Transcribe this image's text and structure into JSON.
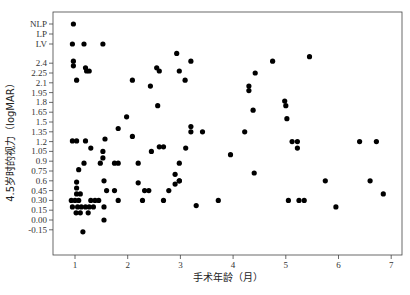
{
  "chart_data": {
    "type": "scatter",
    "title": "",
    "xlabel": "手术年龄（月）",
    "ylabel": "4.5岁时的视力（logMAR）",
    "xlim": [
      0.57,
      7.2
    ],
    "x_ticks": [
      1,
      2,
      3,
      4,
      5,
      6,
      7
    ],
    "y_ticks": [
      {
        "label": "NLP",
        "value": "NLP"
      },
      {
        "label": "LP",
        "value": "LP"
      },
      {
        "label": "LV",
        "value": "LV"
      },
      {
        "label": "2.4",
        "value": 2.4
      },
      {
        "label": "2.25",
        "value": 2.25
      },
      {
        "label": "2.1",
        "value": 2.1
      },
      {
        "label": "1.95",
        "value": 1.95
      },
      {
        "label": "1.8",
        "value": 1.8
      },
      {
        "label": "1.65",
        "value": 1.65
      },
      {
        "label": "1.5",
        "value": 1.5
      },
      {
        "label": "1.35",
        "value": 1.35
      },
      {
        "label": "1.2",
        "value": 1.2
      },
      {
        "label": "1.05",
        "value": 1.05
      },
      {
        "label": "0.9",
        "value": 0.9
      },
      {
        "label": "0.75",
        "value": 0.75
      },
      {
        "label": "0.6",
        "value": 0.6
      },
      {
        "label": "0.45",
        "value": 0.45
      },
      {
        "label": "0.30",
        "value": 0.3
      },
      {
        "label": "0.15",
        "value": 0.15
      },
      {
        "label": "0.00",
        "value": 0.0
      },
      {
        "label": "-0.15",
        "value": -0.15
      }
    ],
    "grid": false,
    "legend": null,
    "points": [
      {
        "x": 0.97,
        "y": "NLP"
      },
      {
        "x": 0.95,
        "y": "LV"
      },
      {
        "x": 1.17,
        "y": "LV"
      },
      {
        "x": 1.53,
        "y": "LV"
      },
      {
        "x": 2.93,
        "y": 2.55
      },
      {
        "x": 0.97,
        "y": 2.43
      },
      {
        "x": 0.97,
        "y": 2.36
      },
      {
        "x": 1.2,
        "y": 2.33
      },
      {
        "x": 1.22,
        "y": 2.28
      },
      {
        "x": 1.27,
        "y": 2.28
      },
      {
        "x": 1.03,
        "y": 2.14
      },
      {
        "x": 2.55,
        "y": 2.33
      },
      {
        "x": 2.6,
        "y": 2.28
      },
      {
        "x": 2.98,
        "y": 2.28
      },
      {
        "x": 3.2,
        "y": 2.43
      },
      {
        "x": 2.09,
        "y": 2.14
      },
      {
        "x": 2.43,
        "y": 2.05
      },
      {
        "x": 3.09,
        "y": 2.14
      },
      {
        "x": 2.57,
        "y": 1.75
      },
      {
        "x": 1.55,
        "y": 0.0
      },
      {
        "x": 0.95,
        "y": 1.21
      },
      {
        "x": 1.03,
        "y": 1.21
      },
      {
        "x": 1.2,
        "y": 1.21
      },
      {
        "x": 1.57,
        "y": 1.24
      },
      {
        "x": 1.98,
        "y": 1.58
      },
      {
        "x": 1.82,
        "y": 1.4
      },
      {
        "x": 1.3,
        "y": 1.1
      },
      {
        "x": 1.53,
        "y": 1.05
      },
      {
        "x": 1.53,
        "y": 0.95
      },
      {
        "x": 1.48,
        "y": 0.87
      },
      {
        "x": 2.09,
        "y": 1.28
      },
      {
        "x": 2.6,
        "y": 1.12
      },
      {
        "x": 2.68,
        "y": 1.12
      },
      {
        "x": 2.45,
        "y": 1.05
      },
      {
        "x": 1.75,
        "y": 0.87
      },
      {
        "x": 1.82,
        "y": 0.87
      },
      {
        "x": 2.2,
        "y": 0.87
      },
      {
        "x": 2.98,
        "y": 0.87
      },
      {
        "x": 3.2,
        "y": 1.43
      },
      {
        "x": 3.2,
        "y": 1.35
      },
      {
        "x": 3.42,
        "y": 1.35
      },
      {
        "x": 3.1,
        "y": 1.1
      },
      {
        "x": 4.75,
        "y": 2.43
      },
      {
        "x": 3.95,
        "y": 1.0
      },
      {
        "x": 2.9,
        "y": 0.7
      },
      {
        "x": 2.98,
        "y": 0.6
      },
      {
        "x": 2.9,
        "y": 0.55
      },
      {
        "x": 2.78,
        "y": 0.45
      },
      {
        "x": 2.2,
        "y": 0.57
      },
      {
        "x": 2.32,
        "y": 0.45
      },
      {
        "x": 2.28,
        "y": 0.3
      },
      {
        "x": 2.4,
        "y": 0.45
      },
      {
        "x": 2.68,
        "y": 0.3
      },
      {
        "x": 2.98,
        "y": 0.6
      },
      {
        "x": 3.3,
        "y": 0.22
      },
      {
        "x": 3.72,
        "y": 0.3
      },
      {
        "x": 1.07,
        "y": 0.77
      },
      {
        "x": 1.17,
        "y": 0.87
      },
      {
        "x": 1.55,
        "y": 0.6
      },
      {
        "x": 1.03,
        "y": 0.58
      },
      {
        "x": 1.03,
        "y": 0.49
      },
      {
        "x": 1.03,
        "y": 0.4
      },
      {
        "x": 1.1,
        "y": 0.4
      },
      {
        "x": 0.93,
        "y": 0.3
      },
      {
        "x": 1.0,
        "y": 0.3
      },
      {
        "x": 1.07,
        "y": 0.3
      },
      {
        "x": 1.3,
        "y": 0.3
      },
      {
        "x": 1.38,
        "y": 0.3
      },
      {
        "x": 1.45,
        "y": 0.3
      },
      {
        "x": 0.95,
        "y": 0.2
      },
      {
        "x": 1.05,
        "y": 0.2
      },
      {
        "x": 1.12,
        "y": 0.2
      },
      {
        "x": 1.2,
        "y": 0.2
      },
      {
        "x": 1.27,
        "y": 0.2
      },
      {
        "x": 1.35,
        "y": 0.2
      },
      {
        "x": 1.55,
        "y": 0.2
      },
      {
        "x": 1.02,
        "y": 0.11
      },
      {
        "x": 1.1,
        "y": 0.11
      },
      {
        "x": 1.25,
        "y": 0.11
      },
      {
        "x": 1.6,
        "y": 0.45
      },
      {
        "x": 1.75,
        "y": 0.45
      },
      {
        "x": 1.82,
        "y": 0.3
      },
      {
        "x": 1.15,
        "y": -0.18
      },
      {
        "x": 4.3,
        "y": 2.05
      },
      {
        "x": 4.3,
        "y": 1.98
      },
      {
        "x": 4.42,
        "y": 2.25
      },
      {
        "x": 4.38,
        "y": 1.68
      },
      {
        "x": 4.22,
        "y": 1.35
      },
      {
        "x": 4.4,
        "y": 0.72
      },
      {
        "x": 4.98,
        "y": 1.82
      },
      {
        "x": 5.0,
        "y": 1.75
      },
      {
        "x": 5.02,
        "y": 1.55
      },
      {
        "x": 5.45,
        "y": 2.5
      },
      {
        "x": 5.12,
        "y": 1.2
      },
      {
        "x": 5.22,
        "y": 1.2
      },
      {
        "x": 5.22,
        "y": 1.1
      },
      {
        "x": 5.05,
        "y": 0.3
      },
      {
        "x": 5.25,
        "y": 0.3
      },
      {
        "x": 5.35,
        "y": 0.3
      },
      {
        "x": 5.75,
        "y": 0.6
      },
      {
        "x": 5.95,
        "y": 0.2
      },
      {
        "x": 6.4,
        "y": 1.2
      },
      {
        "x": 6.6,
        "y": 0.6
      },
      {
        "x": 6.72,
        "y": 1.2
      },
      {
        "x": 6.85,
        "y": 0.4
      }
    ]
  }
}
